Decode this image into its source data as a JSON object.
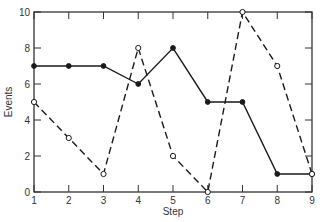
{
  "chart_data": {
    "type": "line",
    "title": "",
    "xlabel": "Step",
    "ylabel": "Events",
    "x": [
      1,
      2,
      3,
      4,
      5,
      6,
      7,
      8,
      9
    ],
    "xlim": [
      1,
      9
    ],
    "ylim": [
      0,
      10
    ],
    "xticks": [
      1,
      2,
      3,
      4,
      5,
      6,
      7,
      8,
      9
    ],
    "yticks": [
      0,
      2,
      4,
      6,
      8,
      10
    ],
    "grid": false,
    "legend": null,
    "series": [
      {
        "name": "Series A (solid, filled markers)",
        "style": "solid",
        "marker": "filled-circle",
        "values": [
          7,
          7,
          7,
          6,
          8,
          5,
          5,
          1,
          1
        ]
      },
      {
        "name": "Series B (dashed, open markers)",
        "style": "dashed",
        "marker": "open-circle",
        "values": [
          5,
          3,
          1,
          8,
          2,
          0,
          10,
          7,
          1
        ]
      }
    ]
  },
  "colors": {
    "line": "#1a1a1a",
    "axis": "#333333",
    "background": "#ffffff"
  }
}
